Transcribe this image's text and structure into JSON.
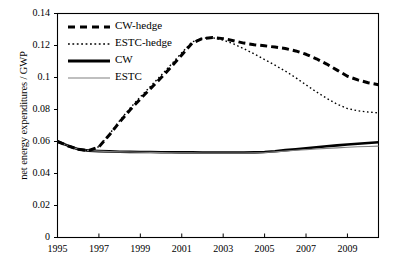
{
  "chart_data": {
    "type": "line",
    "title": "",
    "xlabel": "",
    "ylabel": "net energy expenditures / GWP",
    "xlim": [
      1995,
      2010.5
    ],
    "ylim": [
      0,
      0.14
    ],
    "grid": false,
    "legend_position": "top-left-inside",
    "xticks": [
      1995,
      1997,
      1999,
      2001,
      2003,
      2005,
      2007,
      2009
    ],
    "xtick_labels": [
      "1995",
      "1997",
      "1999",
      "2001",
      "2003",
      "2005",
      "2007",
      "2009"
    ],
    "yticks": [
      0,
      0.02,
      0.04,
      0.06,
      0.08,
      0.1,
      0.12,
      0.14
    ],
    "ytick_labels": [
      "0",
      "0.02",
      "0.04",
      "0.06",
      "0.08",
      "0.1",
      "0.12",
      "0.14"
    ],
    "x": [
      1995,
      1995.5,
      1996,
      1996.5,
      1997,
      1997.5,
      1998,
      1998.5,
      1999,
      1999.5,
      2000,
      2000.5,
      2001,
      2001.5,
      2002,
      2002.5,
      2003,
      2003.5,
      2004,
      2004.5,
      2005,
      2005.5,
      2006,
      2006.5,
      2007,
      2007.5,
      2008,
      2008.5,
      2009,
      2009.5,
      2010,
      2010.5
    ],
    "series": [
      {
        "name": "CW-hedge",
        "style": "thick-dashed",
        "color": "#000000",
        "line_width": 3.0,
        "dash": "7,4",
        "values": [
          0.06,
          0.0573,
          0.0551,
          0.0543,
          0.0566,
          0.064,
          0.0722,
          0.0797,
          0.0866,
          0.0932,
          0.0998,
          0.1068,
          0.1141,
          0.1215,
          0.1244,
          0.125,
          0.1243,
          0.123,
          0.1215,
          0.1205,
          0.1198,
          0.119,
          0.1181,
          0.1166,
          0.1145,
          0.1117,
          0.1084,
          0.1046,
          0.1008,
          0.0985,
          0.0967,
          0.0955
        ]
      },
      {
        "name": "ESTC-hedge",
        "style": "fine-dotted",
        "color": "#000000",
        "line_width": 1.4,
        "dash": "1.6,2.6",
        "values": [
          0.06,
          0.0573,
          0.0551,
          0.0543,
          0.0568,
          0.0645,
          0.073,
          0.0808,
          0.0879,
          0.0946,
          0.1013,
          0.1083,
          0.1155,
          0.1222,
          0.1246,
          0.1248,
          0.1234,
          0.121,
          0.118,
          0.1147,
          0.1112,
          0.1077,
          0.104,
          0.0999,
          0.0954,
          0.091,
          0.087,
          0.0833,
          0.0806,
          0.0792,
          0.0784,
          0.0779
        ]
      },
      {
        "name": "CW",
        "style": "thick-solid",
        "color": "#000000",
        "line_width": 2.6,
        "dash": "",
        "values": [
          0.06,
          0.0574,
          0.0552,
          0.0543,
          0.054,
          0.0538,
          0.0536,
          0.0535,
          0.0534,
          0.0534,
          0.0533,
          0.0533,
          0.0532,
          0.0532,
          0.0531,
          0.0531,
          0.0531,
          0.0531,
          0.0531,
          0.0532,
          0.0534,
          0.0539,
          0.0546,
          0.0552,
          0.0558,
          0.0564,
          0.057,
          0.0576,
          0.0581,
          0.0586,
          0.0591,
          0.0595
        ]
      },
      {
        "name": "ESTC",
        "style": "thin-solid-gray",
        "color": "#808080",
        "line_width": 1.1,
        "dash": "",
        "values": [
          0.06,
          0.0574,
          0.0552,
          0.0543,
          0.054,
          0.0537,
          0.0535,
          0.0534,
          0.0533,
          0.0532,
          0.0531,
          0.053,
          0.0529,
          0.0529,
          0.0528,
          0.0528,
          0.0528,
          0.0528,
          0.0528,
          0.0529,
          0.0531,
          0.0535,
          0.054,
          0.0545,
          0.0549,
          0.0553,
          0.0557,
          0.056,
          0.0564,
          0.0567,
          0.0569,
          0.0571
        ]
      }
    ]
  },
  "legend": {
    "items": [
      {
        "label": "CW-hedge"
      },
      {
        "label": "ESTC-hedge"
      },
      {
        "label": "CW"
      },
      {
        "label": "ESTC"
      }
    ]
  },
  "axes": {
    "y_title": "net energy expenditures / GWP"
  },
  "colors": {
    "axis": "#000000",
    "primary": "#000000",
    "secondary": "#808080",
    "background": "#ffffff"
  }
}
